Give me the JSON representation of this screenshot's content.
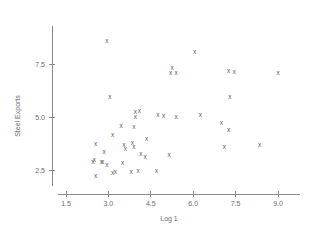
{
  "chart_data": {
    "type": "scatter",
    "title": "",
    "xlabel": "Log 1",
    "ylabel": "Steel Exports",
    "marker": "x",
    "grid": false,
    "legend": null,
    "xlim": [
      1.2,
      9.6
    ],
    "ylim": [
      1.6,
      9.2
    ],
    "xticks": [
      "1.5",
      "3.0",
      "4.5",
      "6.0",
      "7.5",
      "9.0"
    ],
    "xtick_values": [
      1.5,
      3.0,
      4.5,
      6.0,
      7.5,
      9.0
    ],
    "yticks": [
      "2.5",
      "5.0",
      "7.5"
    ],
    "ytick_values": [
      2.5,
      5.0,
      7.5
    ],
    "points": [
      {
        "x": 2.95,
        "y": 8.55
      },
      {
        "x": 6.05,
        "y": 8.05
      },
      {
        "x": 5.25,
        "y": 7.3
      },
      {
        "x": 5.2,
        "y": 7.05
      },
      {
        "x": 5.4,
        "y": 7.05
      },
      {
        "x": 7.25,
        "y": 7.15
      },
      {
        "x": 7.45,
        "y": 7.1
      },
      {
        "x": 9.0,
        "y": 7.05
      },
      {
        "x": 3.05,
        "y": 5.95
      },
      {
        "x": 7.3,
        "y": 5.95
      },
      {
        "x": 3.95,
        "y": 5.2
      },
      {
        "x": 4.1,
        "y": 5.25
      },
      {
        "x": 3.95,
        "y": 5.0
      },
      {
        "x": 4.75,
        "y": 5.1
      },
      {
        "x": 4.95,
        "y": 5.05
      },
      {
        "x": 5.4,
        "y": 5.0
      },
      {
        "x": 6.25,
        "y": 5.1
      },
      {
        "x": 3.45,
        "y": 4.55
      },
      {
        "x": 3.9,
        "y": 4.5
      },
      {
        "x": 7.0,
        "y": 4.7
      },
      {
        "x": 7.25,
        "y": 4.35
      },
      {
        "x": 3.15,
        "y": 4.15
      },
      {
        "x": 4.35,
        "y": 3.95
      },
      {
        "x": 2.55,
        "y": 3.7
      },
      {
        "x": 3.55,
        "y": 3.65
      },
      {
        "x": 3.6,
        "y": 3.5
      },
      {
        "x": 3.85,
        "y": 3.75
      },
      {
        "x": 3.9,
        "y": 3.55
      },
      {
        "x": 7.1,
        "y": 3.55
      },
      {
        "x": 8.35,
        "y": 3.65
      },
      {
        "x": 2.85,
        "y": 3.35
      },
      {
        "x": 4.15,
        "y": 3.25
      },
      {
        "x": 4.3,
        "y": 3.1
      },
      {
        "x": 5.15,
        "y": 3.2
      },
      {
        "x": 2.5,
        "y": 2.95
      },
      {
        "x": 2.45,
        "y": 2.85
      },
      {
        "x": 2.75,
        "y": 2.85
      },
      {
        "x": 2.8,
        "y": 2.85
      },
      {
        "x": 3.5,
        "y": 2.8
      },
      {
        "x": 2.95,
        "y": 2.7
      },
      {
        "x": 3.25,
        "y": 2.4
      },
      {
        "x": 3.15,
        "y": 2.35
      },
      {
        "x": 3.8,
        "y": 2.4
      },
      {
        "x": 4.05,
        "y": 2.45
      },
      {
        "x": 4.7,
        "y": 2.45
      },
      {
        "x": 2.55,
        "y": 2.2
      }
    ]
  }
}
